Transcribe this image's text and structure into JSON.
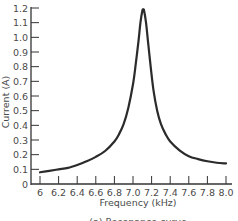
{
  "chart_data": {
    "type": "line",
    "title": "",
    "caption": "(a) Resonance curve",
    "xlabel": "Frequency (kHz)",
    "ylabel": "Current (A)",
    "xlim": [
      6.0,
      8.0
    ],
    "ylim": [
      0,
      1.2
    ],
    "grid": false,
    "legend": "none",
    "x_ticks": [
      "6",
      "6.2",
      "6.4",
      "6.6",
      "6.8",
      "7.0",
      "7.2",
      "7.4",
      "7.6",
      "7.8",
      "8.0"
    ],
    "x_tick_values": [
      6.0,
      6.2,
      6.4,
      6.6,
      6.8,
      7.0,
      7.2,
      7.4,
      7.6,
      7.8,
      8.0
    ],
    "y_ticks": [
      "0",
      "0.1",
      "0.2",
      "0.3",
      "0.4",
      "0.5",
      "0.6",
      "0.7",
      "0.8",
      "0.9",
      "1.0",
      "1.1",
      "1.2"
    ],
    "y_tick_values": [
      0,
      0.1,
      0.2,
      0.3,
      0.4,
      0.5,
      0.6,
      0.7,
      0.8,
      0.9,
      1.0,
      1.1,
      1.2
    ],
    "series": [
      {
        "name": "Current",
        "color": "#2b2b2b",
        "x": [
          6.0,
          6.1,
          6.2,
          6.3,
          6.4,
          6.5,
          6.6,
          6.7,
          6.8,
          6.85,
          6.9,
          6.95,
          7.0,
          7.03,
          7.06,
          7.08,
          7.1,
          7.11,
          7.12,
          7.14,
          7.16,
          7.19,
          7.22,
          7.26,
          7.3,
          7.35,
          7.4,
          7.5,
          7.6,
          7.7,
          7.8,
          7.9,
          8.0
        ],
        "y": [
          0.08,
          0.09,
          0.1,
          0.11,
          0.13,
          0.155,
          0.185,
          0.225,
          0.29,
          0.34,
          0.41,
          0.52,
          0.68,
          0.82,
          0.98,
          1.1,
          1.18,
          1.19,
          1.18,
          1.1,
          0.98,
          0.8,
          0.64,
          0.5,
          0.41,
          0.34,
          0.29,
          0.23,
          0.19,
          0.17,
          0.155,
          0.145,
          0.14
        ]
      }
    ]
  }
}
